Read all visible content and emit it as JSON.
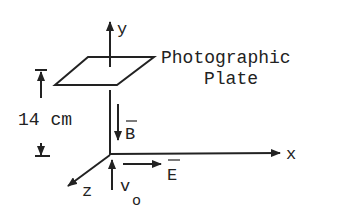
{
  "diagram": {
    "axes": {
      "x_label": "x",
      "y_label": "y",
      "z_label": "z"
    },
    "plate": {
      "label_line1": "Photographic",
      "label_line2": "Plate"
    },
    "distance": {
      "label": "14 cm"
    },
    "vectors": {
      "magnetic_field_label": "B",
      "electric_field_label": "E",
      "velocity_label": "v",
      "velocity_subscript": "o"
    },
    "colors": {
      "ink": "#222222",
      "background": "#ffffff"
    }
  }
}
